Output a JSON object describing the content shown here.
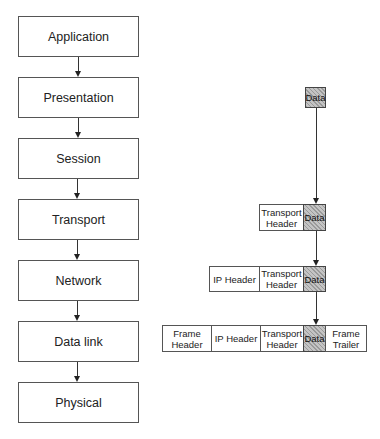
{
  "diagram": {
    "layers": [
      {
        "label": "Application"
      },
      {
        "label": "Presentation"
      },
      {
        "label": "Session"
      },
      {
        "label": "Transport"
      },
      {
        "label": "Network"
      },
      {
        "label": "Data link"
      },
      {
        "label": "Physical"
      }
    ],
    "encapsulation": {
      "data_only": {
        "data": "Data"
      },
      "transport_segment": {
        "transport_header": "Transport Header",
        "data": "Data"
      },
      "ip_packet": {
        "ip_header": "IP Header",
        "transport_header": "Transport Header",
        "data": "Data"
      },
      "frame": {
        "frame_header": "Frame Header",
        "ip_header": "IP Header",
        "transport_header": "Transport Header",
        "data": "Data",
        "frame_trailer": "Frame Trailer"
      }
    }
  }
}
